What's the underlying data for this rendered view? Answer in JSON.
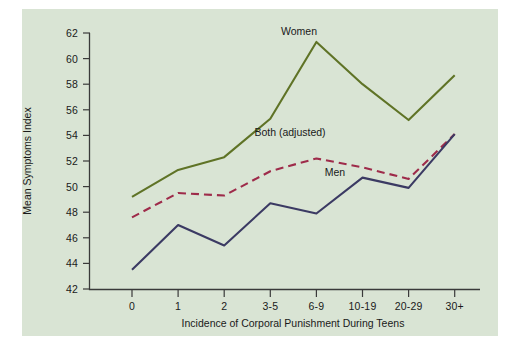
{
  "chart_data": {
    "type": "line",
    "title": "",
    "xlabel": "Incidence of Corporal Punishment During Teens",
    "ylabel": "Mean Symptoms Index",
    "categories": [
      "0",
      "1",
      "2",
      "3-5",
      "6-9",
      "10-19",
      "20-29",
      "30+"
    ],
    "xticks": [
      "0",
      "1",
      "2",
      "3-5",
      "6-9",
      "10-19",
      "20-29",
      "30+"
    ],
    "yticks": [
      "42",
      "44",
      "46",
      "48",
      "50",
      "52",
      "54",
      "56",
      "58",
      "60",
      "62"
    ],
    "ylim": [
      42,
      62
    ],
    "grid": false,
    "legend_position": "inline-annotations",
    "series": [
      {
        "name": "Women",
        "color": "#5f7326",
        "style": "solid",
        "label_x_category": "3-5",
        "values": [
          49.2,
          51.3,
          52.3,
          55.3,
          61.3,
          58.0,
          55.2,
          58.7
        ]
      },
      {
        "name": "Both (adjusted)",
        "color": "#9e2b4a",
        "style": "dashed",
        "label_x_category": "3-5",
        "values": [
          47.6,
          49.5,
          49.3,
          51.2,
          52.2,
          51.5,
          50.6,
          54.1
        ]
      },
      {
        "name": "Men",
        "color": "#3b3a63",
        "style": "solid",
        "label_x_category": "6-9",
        "values": [
          43.5,
          47.0,
          45.4,
          48.7,
          47.9,
          50.7,
          49.9,
          54.1
        ]
      }
    ]
  },
  "panel": {
    "background_color": "#d9e4d4",
    "axis_color": "#3a3a3a"
  },
  "annotations": {
    "women_label": "Women",
    "both_label": "Both (adjusted)",
    "men_label": "Men"
  }
}
